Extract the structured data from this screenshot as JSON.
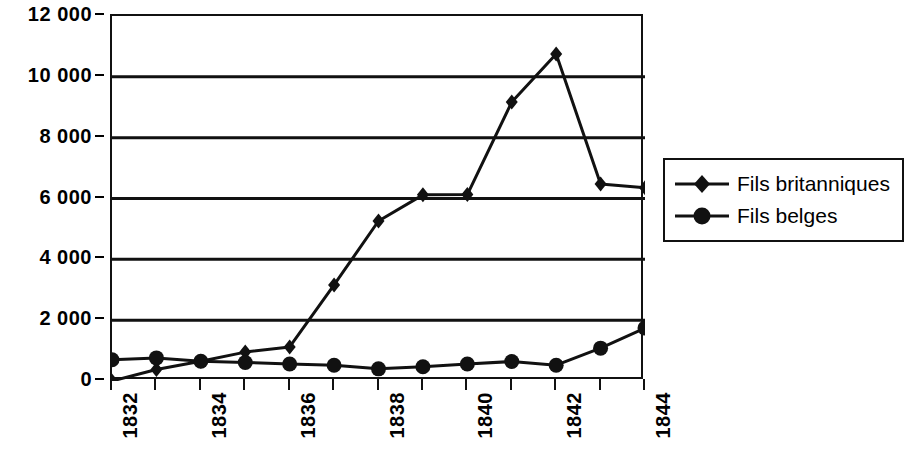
{
  "chart_data": {
    "type": "line",
    "title": "",
    "subtitle": "",
    "xlabel": "",
    "ylabel": "",
    "categories": [
      "1832",
      "1833",
      "1834",
      "1835",
      "1836",
      "1837",
      "1838",
      "1839",
      "1840",
      "1841",
      "1842",
      "1843",
      "1844"
    ],
    "x_tick_labels": [
      "1832",
      "",
      "1834",
      "",
      "1836",
      "",
      "1838",
      "",
      "1840",
      "",
      "1842",
      "",
      "1844"
    ],
    "y_tick_labels": [
      "0",
      "2 000",
      "4 000",
      "6 000",
      "8 000",
      "10 000",
      "12 000"
    ],
    "y_tick_values": [
      0,
      2000,
      4000,
      6000,
      8000,
      10000,
      12000
    ],
    "ylim": [
      0,
      12000
    ],
    "grid": "horizontal",
    "legend_position": "right",
    "series": [
      {
        "name": "Fils britanniques",
        "marker": "diamond",
        "color": "#111111",
        "values": [
          0,
          380,
          650,
          950,
          1120,
          3160,
          5260,
          6120,
          6130,
          9170,
          10750,
          6480,
          6350
        ]
      },
      {
        "name": "Fils belges",
        "marker": "circle",
        "color": "#111111",
        "values": [
          700,
          760,
          650,
          610,
          560,
          520,
          400,
          470,
          560,
          640,
          520,
          1080,
          1740
        ]
      }
    ]
  },
  "legend": {
    "items": [
      {
        "label": "Fils britanniques",
        "marker": "diamond"
      },
      {
        "label": "Fils belges",
        "marker": "circle"
      }
    ]
  }
}
